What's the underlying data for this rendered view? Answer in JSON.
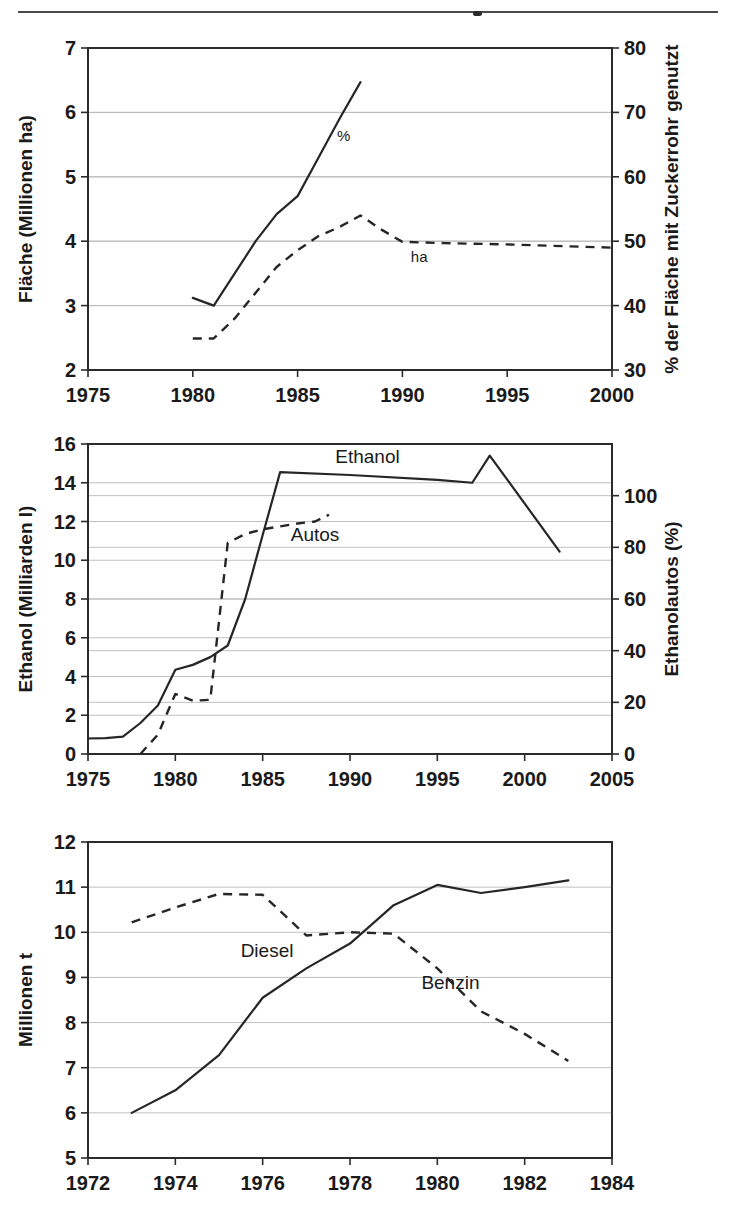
{
  "page": {
    "divider_label": "horizontal-rule"
  },
  "chart_data": [
    {
      "id": "flaeche-zuckerrohr",
      "type": "line",
      "title": "",
      "xlabel": "",
      "ylabel": "Fläche (Millionen ha)",
      "y2label": "% der Fläche mit Zuckerrohr genutzt",
      "xlim": [
        1975,
        2000
      ],
      "ylim": [
        2,
        7
      ],
      "y2lim": [
        30,
        80
      ],
      "xticks": [
        1975,
        1980,
        1985,
        1990,
        1995,
        2000
      ],
      "yticks": [
        2,
        3,
        4,
        5,
        6,
        7
      ],
      "y2ticks": [
        30,
        40,
        50,
        60,
        70,
        80
      ],
      "grid": true,
      "legend_position": "inline-annotation",
      "series": [
        {
          "name": "%",
          "style": "solid",
          "axis": "right",
          "label_x": 1987.2,
          "label_y": 5.55,
          "label_size": "small",
          "points": [
            [
              1980,
              3.12
            ],
            [
              1981,
              3.0
            ],
            [
              1982,
              3.5
            ],
            [
              1983,
              4.0
            ],
            [
              1984,
              4.42
            ],
            [
              1985,
              4.7
            ],
            [
              1986,
              5.3
            ],
            [
              1987,
              5.9
            ],
            [
              1988,
              6.47
            ]
          ]
        },
        {
          "name": "ha",
          "style": "dashed",
          "axis": "left",
          "label_x": 1990.8,
          "label_y": 3.68,
          "label_size": "small",
          "points": [
            [
              1980,
              2.49
            ],
            [
              1981,
              2.49
            ],
            [
              1982,
              2.8
            ],
            [
              1983,
              3.2
            ],
            [
              1984,
              3.6
            ],
            [
              1985,
              3.86
            ],
            [
              1986,
              4.08
            ],
            [
              1987,
              4.22
            ],
            [
              1988,
              4.4
            ],
            [
              1989,
              4.18
            ],
            [
              1990,
              3.99
            ],
            [
              1992,
              3.97
            ],
            [
              1995,
              3.95
            ],
            [
              1998,
              3.92
            ],
            [
              2000,
              3.9
            ]
          ]
        }
      ]
    },
    {
      "id": "ethanol-autos",
      "type": "line",
      "title": "",
      "xlabel": "",
      "ylabel": "Ethanol (Milliarden l)",
      "y2label": "Ethanolautos (%)",
      "xlim": [
        1975,
        2005
      ],
      "ylim": [
        0,
        16
      ],
      "y2lim": [
        0,
        120
      ],
      "xticks": [
        1975,
        1980,
        1985,
        1990,
        1995,
        2000,
        2005
      ],
      "yticks": [
        0,
        2,
        4,
        6,
        8,
        10,
        12,
        14,
        16
      ],
      "y2ticks": [
        0,
        20,
        40,
        60,
        80,
        100
      ],
      "grid": true,
      "legend_position": "inline-annotation",
      "series": [
        {
          "name": "Ethanol",
          "style": "solid",
          "axis": "left",
          "label_x": 1991.0,
          "label_y": 15.0,
          "label_size": "normal",
          "points": [
            [
              1975,
              0.8
            ],
            [
              1976,
              0.82
            ],
            [
              1977,
              0.9
            ],
            [
              1978,
              1.6
            ],
            [
              1979,
              2.5
            ],
            [
              1980,
              4.35
            ],
            [
              1981,
              4.6
            ],
            [
              1982,
              5.0
            ],
            [
              1983,
              5.6
            ],
            [
              1984,
              8.0
            ],
            [
              1985,
              11.3
            ],
            [
              1986,
              14.55
            ],
            [
              1990,
              14.4
            ],
            [
              1995,
              14.15
            ],
            [
              1997,
              14.0
            ],
            [
              1998,
              15.4
            ],
            [
              2002,
              10.45
            ]
          ]
        },
        {
          "name": "Autos",
          "style": "dashed",
          "axis": "right",
          "label_x": 1988.0,
          "label_y": 11.0,
          "label_size": "normal",
          "points": [
            [
              1978,
              0.0
            ],
            [
              1979,
              1.0
            ],
            [
              1980,
              3.1
            ],
            [
              1981,
              2.75
            ],
            [
              1982,
              2.8
            ],
            [
              1983,
              10.9
            ],
            [
              1984,
              11.35
            ],
            [
              1985,
              11.6
            ],
            [
              1986,
              11.75
            ],
            [
              1987,
              11.9
            ],
            [
              1988,
              12.0
            ],
            [
              1988.8,
              12.35
            ]
          ]
        }
      ]
    },
    {
      "id": "diesel-benzin",
      "type": "line",
      "title": "",
      "xlabel": "",
      "ylabel": "Millionen t",
      "xlim": [
        1972,
        1984
      ],
      "ylim": [
        5,
        12
      ],
      "xticks": [
        1972,
        1974,
        1976,
        1978,
        1980,
        1982,
        1984
      ],
      "yticks": [
        5,
        6,
        7,
        8,
        9,
        10,
        11,
        12
      ],
      "grid": true,
      "legend_position": "inline-annotation",
      "series": [
        {
          "name": "Diesel",
          "style": "solid",
          "axis": "left",
          "label_x": 1976.1,
          "label_y": 9.45,
          "label_size": "normal",
          "points": [
            [
              1973,
              6.0
            ],
            [
              1974,
              6.5
            ],
            [
              1975,
              7.28
            ],
            [
              1976,
              8.55
            ],
            [
              1977,
              9.2
            ],
            [
              1978,
              9.75
            ],
            [
              1979,
              10.6
            ],
            [
              1980,
              11.05
            ],
            [
              1981,
              10.87
            ],
            [
              1982,
              11.0
            ],
            [
              1983,
              11.15
            ]
          ]
        },
        {
          "name": "Benzin",
          "style": "dashed",
          "axis": "left",
          "label_x": 1980.3,
          "label_y": 8.75,
          "label_size": "normal",
          "points": [
            [
              1973,
              10.22
            ],
            [
              1974,
              10.55
            ],
            [
              1975,
              10.85
            ],
            [
              1976,
              10.83
            ],
            [
              1977,
              9.93
            ],
            [
              1978,
              10.0
            ],
            [
              1979,
              9.97
            ],
            [
              1980,
              9.2
            ],
            [
              1981,
              8.25
            ],
            [
              1982,
              7.75
            ],
            [
              1983,
              7.15
            ]
          ]
        }
      ]
    }
  ]
}
